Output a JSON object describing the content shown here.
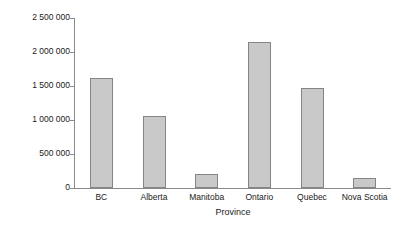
{
  "chart_data": {
    "type": "bar",
    "title": "",
    "subtitle": "",
    "xlabel": "Province",
    "ylabel": "Visits",
    "categories": [
      "BC",
      "Alberta",
      "Manitoba",
      "Ontario",
      "Quebec",
      "Nova Scotia"
    ],
    "values": [
      1620000,
      1060000,
      210000,
      2145000,
      1470000,
      150000
    ],
    "ylim": [
      0,
      2500000
    ],
    "xlim": null,
    "ytick_values": [
      0,
      500000,
      1000000,
      1500000,
      2000000,
      2500000
    ],
    "ytick_labels": [
      "0",
      "500 000",
      "1 000 000",
      "1 500 000",
      "2 000 000",
      "2 500 000"
    ],
    "grid": false,
    "legend": null,
    "legend_position": "none",
    "annotations": [],
    "series": [
      {
        "name": "Visits",
        "values": [
          1620000,
          1060000,
          210000,
          2145000,
          1470000,
          150000
        ]
      }
    ]
  },
  "style": {
    "background_color": "#ffffff",
    "bar_fill_color": "#c9c9c9",
    "bar_border_color": "#858585",
    "axis_color": "#8a8a8a",
    "text_color": "#1a1a1a"
  }
}
